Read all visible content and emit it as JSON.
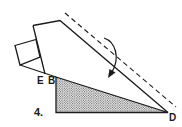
{
  "diagram": {
    "type": "origami-fold-step",
    "step_number": "4.",
    "labels": {
      "e": "E",
      "b": "B",
      "d": "D"
    },
    "colors": {
      "line": "#1a1a1a",
      "background": "#ffffff",
      "shading_dot": "#333333"
    },
    "elements": [
      "folded-paper-outline",
      "small-flap",
      "dashed-fold-line",
      "curved-fold-arrow",
      "shaded-triangle"
    ]
  }
}
